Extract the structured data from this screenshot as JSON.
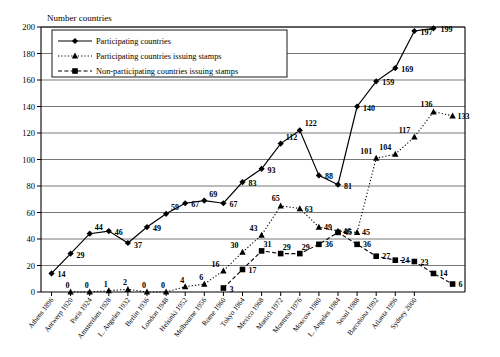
{
  "chart_data": {
    "type": "line",
    "title": "",
    "ylabel": "Number countries",
    "xlabel": "",
    "ylim": [
      0,
      200
    ],
    "yticks": [
      0,
      20,
      40,
      60,
      80,
      100,
      120,
      140,
      160,
      180,
      200
    ],
    "grid": true,
    "legend_position": "top-left",
    "categories": [
      "Athens 1896",
      "Antwerp 1920",
      "Paris 1924",
      "Amsterdam 1928",
      "L. Angeles 1932",
      "Berlin 1936",
      "London 1948",
      "Helsinki 1952",
      "Melbourne 1956",
      "Rome 1960",
      "Tokyo 1964",
      "Mexico 1968",
      "Munich 1972",
      "Montreal 1976",
      "Moscow 1980",
      "L. Angeles 1984",
      "Seoul 1988",
      "Barcelona 1992",
      "Atlanta 1996",
      "Sydney 2000"
    ],
    "series": [
      {
        "name": "Participating countries",
        "marker": "diamond",
        "line": "solid",
        "values": [
          14,
          29,
          44,
          46,
          37,
          49,
          59,
          67,
          69,
          67,
          83,
          93,
          112,
          122,
          88,
          81,
          140,
          159,
          169,
          197
        ],
        "extra_point": {
          "label": "199",
          "value": 199
        }
      },
      {
        "name": "Participating countries issuing stamps",
        "marker": "triangle",
        "line": "dotted",
        "values": [
          null,
          0,
          0,
          1,
          2,
          0,
          0,
          4,
          6,
          16,
          30,
          43,
          65,
          63,
          49,
          46,
          45,
          101,
          104,
          117
        ],
        "extra_points": [
          {
            "label": "136",
            "value": 136
          },
          {
            "label": "133",
            "value": 133
          }
        ]
      },
      {
        "name": "Non-participating countries issuing stamps",
        "marker": "square",
        "line": "dashed",
        "values": [
          null,
          null,
          null,
          null,
          null,
          null,
          null,
          null,
          null,
          3,
          17,
          31,
          29,
          29,
          36,
          45,
          36,
          27,
          24,
          23
        ],
        "extra_points": [
          {
            "label": "14",
            "value": 14
          },
          {
            "label": "6",
            "value": 6
          }
        ]
      }
    ]
  },
  "legend": {
    "items": [
      {
        "label": "Participating countries",
        "marker": "diamond",
        "style": "solid"
      },
      {
        "label": "Participating countries issuing stamps",
        "marker": "triangle",
        "style": "dotted"
      },
      {
        "label": "Non-participating countries issuing stamps",
        "marker": "square",
        "style": "dashed"
      }
    ]
  },
  "axis": {
    "y_title": "Number countries",
    "y_tick_labels": [
      "0",
      "20",
      "40",
      "60",
      "80",
      "100",
      "120",
      "140",
      "160",
      "180",
      "200"
    ],
    "x_tick_labels": [
      "Athens 1896",
      "Antwerp 1920",
      "Paris 1924",
      "Amsterdam 1928",
      "L. Angeles 1932",
      "Berlin 1936",
      "London 1948",
      "Helsinki 1952",
      "Melbourne 1956",
      "Rome 1960",
      "Tokyo 1964",
      "Mexico 1968",
      "Munich 1972",
      "Montreal 1976",
      "Moscow 1980",
      "L. Angeles 1984",
      "Seoul 1988",
      "Barcelona 1992",
      "Atlanta 1996",
      "Sydney 2000"
    ]
  },
  "data_labels": {
    "participating": [
      "14",
      "29",
      "44",
      "46",
      "37",
      "49",
      "59",
      "67",
      "69",
      "67",
      "83",
      "93",
      "112",
      "122",
      "88",
      "81",
      "140",
      "159",
      "169",
      "197",
      "199"
    ],
    "participating_stamps": [
      "0",
      "0",
      "1",
      "2",
      "0",
      "0",
      "4",
      "6",
      "16",
      "30",
      "43",
      "65",
      "63",
      "49",
      "46",
      "45",
      "101",
      "104",
      "117",
      "136",
      "133"
    ],
    "non_participating_stamps": [
      "3",
      "17",
      "31",
      "29",
      "29",
      "36",
      "45",
      "36",
      "27",
      "24",
      "23",
      "14",
      "6"
    ]
  }
}
